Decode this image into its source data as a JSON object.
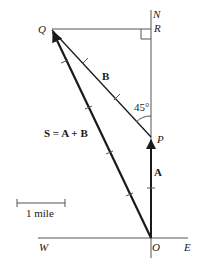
{
  "diagram": {
    "points": {
      "Q": "Q",
      "R": "R",
      "P": "P",
      "O": "O"
    },
    "compass": {
      "north": "N",
      "west": "W",
      "east": "E"
    },
    "vectors": {
      "A": "A",
      "B": "B",
      "S": "S = A + B"
    },
    "angle_label": "45°",
    "scale_label": "1 mile",
    "colors": {
      "line": "#1a1a1a",
      "thin_line": "#555555",
      "background": "#ffffff"
    }
  }
}
